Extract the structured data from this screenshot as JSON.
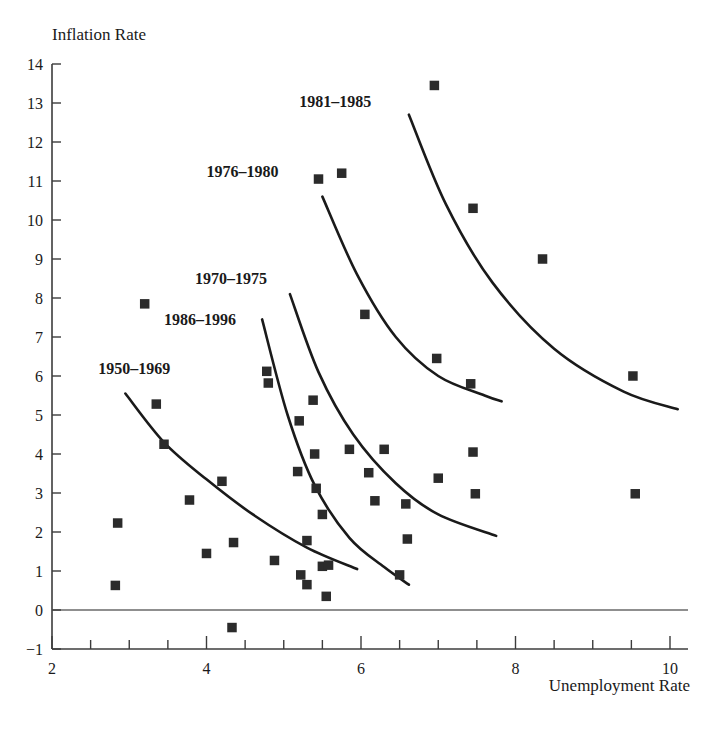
{
  "chart_data": {
    "type": "scatter",
    "title": "",
    "xlabel": "Unemployment Rate",
    "ylabel": "Inflation Rate",
    "xlim": [
      2,
      10.4
    ],
    "ylim": [
      -1,
      14
    ],
    "xticks": [
      2,
      4,
      6,
      8,
      10
    ],
    "xtick_minor_step": 0.5,
    "yticks": [
      -1,
      0,
      1,
      2,
      3,
      4,
      5,
      6,
      7,
      8,
      9,
      10,
      11,
      12,
      13,
      14
    ],
    "grid": false,
    "legend_position": "inline-curve-labels",
    "zero_line": 0,
    "marker": "filled-square",
    "marker_color": "#2b2b2b",
    "curve_color": "#1a1a1a",
    "points": [
      {
        "x": 2.85,
        "y": 2.23
      },
      {
        "x": 2.82,
        "y": 0.63
      },
      {
        "x": 3.2,
        "y": 7.85
      },
      {
        "x": 3.35,
        "y": 5.28
      },
      {
        "x": 3.45,
        "y": 4.25
      },
      {
        "x": 3.78,
        "y": 2.82
      },
      {
        "x": 4.0,
        "y": 1.45
      },
      {
        "x": 4.2,
        "y": 3.3
      },
      {
        "x": 4.35,
        "y": 1.73
      },
      {
        "x": 4.33,
        "y": -0.45
      },
      {
        "x": 4.78,
        "y": 6.12
      },
      {
        "x": 4.8,
        "y": 5.82
      },
      {
        "x": 4.88,
        "y": 1.27
      },
      {
        "x": 5.2,
        "y": 4.85
      },
      {
        "x": 5.18,
        "y": 3.55
      },
      {
        "x": 5.22,
        "y": 0.9
      },
      {
        "x": 5.3,
        "y": 1.78
      },
      {
        "x": 5.3,
        "y": 0.65
      },
      {
        "x": 5.38,
        "y": 5.38
      },
      {
        "x": 5.4,
        "y": 4.0
      },
      {
        "x": 5.42,
        "y": 3.12
      },
      {
        "x": 5.45,
        "y": 11.05
      },
      {
        "x": 5.5,
        "y": 2.45
      },
      {
        "x": 5.5,
        "y": 1.12
      },
      {
        "x": 5.58,
        "y": 1.15
      },
      {
        "x": 5.55,
        "y": 0.35
      },
      {
        "x": 5.75,
        "y": 11.2
      },
      {
        "x": 5.85,
        "y": 4.12
      },
      {
        "x": 6.05,
        "y": 7.58
      },
      {
        "x": 6.1,
        "y": 3.52
      },
      {
        "x": 6.18,
        "y": 2.8
      },
      {
        "x": 6.3,
        "y": 4.12
      },
      {
        "x": 6.5,
        "y": 0.9
      },
      {
        "x": 6.58,
        "y": 2.72
      },
      {
        "x": 6.6,
        "y": 1.82
      },
      {
        "x": 6.95,
        "y": 13.45
      },
      {
        "x": 6.98,
        "y": 6.45
      },
      {
        "x": 7.0,
        "y": 3.38
      },
      {
        "x": 7.42,
        "y": 5.8
      },
      {
        "x": 7.45,
        "y": 10.3
      },
      {
        "x": 7.45,
        "y": 4.05
      },
      {
        "x": 7.48,
        "y": 2.98
      },
      {
        "x": 8.35,
        "y": 9.0
      },
      {
        "x": 9.52,
        "y": 6.0
      },
      {
        "x": 9.55,
        "y": 2.98
      }
    ],
    "curves": [
      {
        "name": "1950-1969",
        "label": "1950–1969",
        "label_x": 2.6,
        "label_y": 6.05,
        "path": [
          {
            "x": 2.95,
            "y": 5.55
          },
          {
            "x": 3.45,
            "y": 4.3
          },
          {
            "x": 4.0,
            "y": 3.35
          },
          {
            "x": 4.6,
            "y": 2.45
          },
          {
            "x": 5.3,
            "y": 1.6
          },
          {
            "x": 5.95,
            "y": 1.05
          }
        ]
      },
      {
        "name": "1986-1996",
        "label": "1986–1996",
        "label_x": 3.45,
        "label_y": 7.3,
        "path": [
          {
            "x": 4.72,
            "y": 7.45
          },
          {
            "x": 5.05,
            "y": 5.0
          },
          {
            "x": 5.4,
            "y": 3.2
          },
          {
            "x": 5.85,
            "y": 1.85
          },
          {
            "x": 6.3,
            "y": 1.1
          },
          {
            "x": 6.62,
            "y": 0.65
          }
        ]
      },
      {
        "name": "1970-1975",
        "label": "1970–1975",
        "label_x": 3.85,
        "label_y": 8.35,
        "path": [
          {
            "x": 5.08,
            "y": 8.1
          },
          {
            "x": 5.45,
            "y": 6.1
          },
          {
            "x": 5.9,
            "y": 4.5
          },
          {
            "x": 6.45,
            "y": 3.25
          },
          {
            "x": 7.0,
            "y": 2.45
          },
          {
            "x": 7.75,
            "y": 1.9
          }
        ]
      },
      {
        "name": "1976-1980",
        "label": "1976–1980",
        "label_x": 4.0,
        "label_y": 11.1,
        "path": [
          {
            "x": 5.5,
            "y": 10.6
          },
          {
            "x": 5.95,
            "y": 8.6
          },
          {
            "x": 6.45,
            "y": 7.0
          },
          {
            "x": 7.0,
            "y": 6.0
          },
          {
            "x": 7.6,
            "y": 5.5
          },
          {
            "x": 7.82,
            "y": 5.35
          }
        ]
      },
      {
        "name": "1981-1985",
        "label": "1981–1985",
        "label_x": 5.2,
        "label_y": 12.9,
        "path": [
          {
            "x": 6.62,
            "y": 12.7
          },
          {
            "x": 7.1,
            "y": 10.4
          },
          {
            "x": 7.7,
            "y": 8.4
          },
          {
            "x": 8.5,
            "y": 6.7
          },
          {
            "x": 9.4,
            "y": 5.6
          },
          {
            "x": 10.1,
            "y": 5.15
          }
        ]
      }
    ]
  }
}
